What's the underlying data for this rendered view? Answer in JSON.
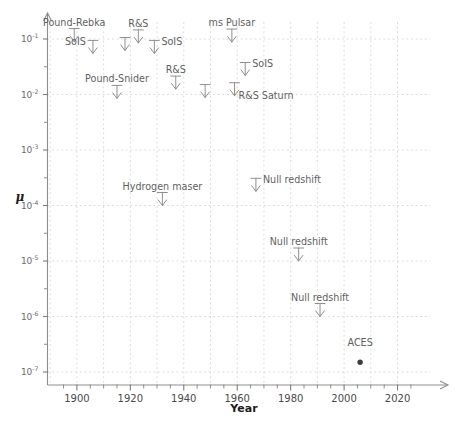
{
  "chart_data": {
    "type": "scatter",
    "title": "",
    "xlabel": "Year",
    "ylabel": "μ",
    "xlim": [
      1889,
      2026
    ],
    "ylim": [
      1e-07,
      0.22
    ],
    "yscale": "log",
    "grid": true,
    "legend": "none",
    "xticks": [
      1900,
      1920,
      1940,
      1960,
      1980,
      2000,
      2020
    ],
    "xtick_labels": [
      "1900",
      "1920",
      "1940",
      "1960",
      "1980",
      "2000",
      "2020"
    ],
    "xminor_ticks": [
      1895,
      1905,
      1910,
      1915,
      1925,
      1930,
      1935,
      1945,
      1950,
      1955,
      1965,
      1970,
      1975,
      1985,
      1990,
      1995,
      2005,
      2010,
      2015,
      2025
    ],
    "yticks": [
      0.1,
      0.01,
      0.001,
      0.0001,
      1e-05,
      1e-06,
      1e-07
    ],
    "ytick_labels": [
      {
        "mantissa": "10",
        "exponent": "-1"
      },
      {
        "mantissa": "10",
        "exponent": "-2"
      },
      {
        "mantissa": "10",
        "exponent": "-3"
      },
      {
        "mantissa": "10",
        "exponent": "-4"
      },
      {
        "mantissa": "10",
        "exponent": "-5"
      },
      {
        "mantissa": "10",
        "exponent": "-6"
      },
      {
        "mantissa": "10",
        "exponent": "-7"
      }
    ],
    "yminor_ticks": [
      0.0316,
      0.00316,
      0.000316,
      3.16e-05,
      3.16e-06,
      3.16e-07
    ],
    "points": [
      {
        "label": "Pound-Rebka",
        "x": 1899,
        "y": 0.09,
        "marker": "down-arrow",
        "label_pos": "above",
        "label_dx": 0,
        "label_dy": -10
      },
      {
        "label": "SoIS",
        "x": 1906,
        "y": 0.055,
        "marker": "down-arrow",
        "label_pos": "left",
        "label_dx": -9,
        "label_dy": 2
      },
      {
        "label": "",
        "x": 1918,
        "y": 0.062,
        "marker": "down-arrow",
        "label_pos": "none",
        "label_dx": 0,
        "label_dy": 0
      },
      {
        "label": "R&S",
        "x": 1923,
        "y": 0.085,
        "marker": "down-arrow",
        "label_pos": "above",
        "label_dx": 0,
        "label_dy": -10
      },
      {
        "label": "SoIS",
        "x": 1929,
        "y": 0.055,
        "marker": "down-arrow",
        "label_pos": "right",
        "label_dx": 9,
        "label_dy": 2
      },
      {
        "label": "ms Pulsar",
        "x": 1958,
        "y": 0.088,
        "marker": "down-arrow",
        "label_pos": "above",
        "label_dx": 0,
        "label_dy": -10
      },
      {
        "label": "SoIS",
        "x": 1963,
        "y": 0.022,
        "marker": "down-arrow",
        "label_pos": "right",
        "label_dx": 9,
        "label_dy": 2
      },
      {
        "label": "Pound-Snider",
        "x": 1915,
        "y": 0.0085,
        "marker": "down-arrow",
        "label_pos": "above",
        "label_dx": 0,
        "label_dy": -10
      },
      {
        "label": "R&S",
        "x": 1937,
        "y": 0.0125,
        "marker": "down-arrow",
        "label_pos": "above",
        "label_dx": 0,
        "label_dy": -10
      },
      {
        "label": "",
        "x": 1948,
        "y": 0.0088,
        "marker": "down-arrow",
        "label_pos": "none",
        "label_dx": 0,
        "label_dy": 0
      },
      {
        "label": "R&S Saturn",
        "x": 1959,
        "y": 0.0095,
        "marker": "down-arrow",
        "label_pos": "below-right",
        "label_dx": 5,
        "label_dy": 10
      },
      {
        "label": "Hydrogen maser",
        "x": 1932,
        "y": 0.0001,
        "marker": "down-arrow",
        "label_pos": "above",
        "label_dx": 0,
        "label_dy": -10
      },
      {
        "label": "Null redshift",
        "x": 1967,
        "y": 0.00018,
        "marker": "down-arrow",
        "label_pos": "right",
        "label_dx": 9,
        "label_dy": 2
      },
      {
        "label": "Null redshift",
        "x": 1983,
        "y": 1e-05,
        "marker": "down-arrow",
        "label_pos": "above",
        "label_dx": 0,
        "label_dy": -10
      },
      {
        "label": "Null redshift",
        "x": 1991,
        "y": 1e-06,
        "marker": "down-arrow",
        "label_pos": "above",
        "label_dx": 0,
        "label_dy": -10
      },
      {
        "label": "ACES",
        "x": 2006,
        "y": 1.5e-07,
        "marker": "dot",
        "label_pos": "above",
        "label_dx": 0,
        "label_dy": -9
      }
    ]
  },
  "colors": {
    "background": "#ffffff",
    "axis": "#8d8d8d",
    "grid": "#cfcfcf",
    "marker": "#8a8a8a",
    "dot": "#3c3c3c",
    "label_text": "#5f5f5f",
    "axis_title": "#1d1d1d"
  }
}
